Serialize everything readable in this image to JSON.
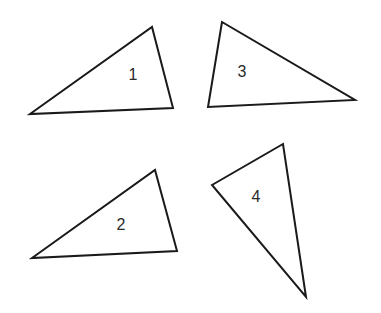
{
  "diagram": {
    "background": "#ffffff",
    "stroke_color": "#1a1a1a",
    "triangles": [
      {
        "label": "1",
        "points": "30,114 152,27 173,108",
        "label_pos": [
          133,
          76
        ]
      },
      {
        "label": "2",
        "points": "32,258 155,170 177,251",
        "label_pos": [
          121,
          226
        ]
      },
      {
        "label": "3",
        "points": "222,22 208,107 355,100",
        "label_pos": [
          242,
          73
        ]
      },
      {
        "label": "4",
        "points": "212,185 283,144 306,297",
        "label_pos": [
          256,
          198
        ]
      }
    ]
  }
}
